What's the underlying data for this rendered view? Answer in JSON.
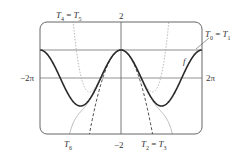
{
  "chart_data": {
    "type": "line",
    "title": "",
    "xlabel": "",
    "ylabel": "",
    "xlim": [
      -6.2832,
      6.2832
    ],
    "ylim": [
      -2,
      2
    ],
    "grid": false,
    "legend": "inline labels",
    "tick_labels": {
      "x_left": "−2π",
      "x_right": "2π",
      "y_top": "2",
      "y_bottom": "−2"
    },
    "series": [
      {
        "name": "f",
        "formula": "cos(x)",
        "style": "solid-thick",
        "color": "#2a2a2a",
        "label": "f"
      },
      {
        "name": "T0 = T1",
        "formula": "1",
        "style": "solid",
        "color": "#7a7a7a",
        "label": "T0 = T1"
      },
      {
        "name": "T2 = T3",
        "formula": "1 - x^2/2",
        "style": "dashed",
        "color": "#333333",
        "label": "T2 = T3"
      },
      {
        "name": "T4 = T5",
        "formula": "1 - x^2/2 + x^4/24",
        "style": "dotted",
        "color": "#b0b0b0",
        "label": "T4 = T5"
      },
      {
        "name": "T6",
        "formula": "1 - x^2/2 + x^4/24 - x^6/720",
        "style": "solid-thin",
        "color": "#a0a0a0",
        "label": "T6"
      }
    ]
  },
  "labels": {
    "t4t5": {
      "T": "T",
      "sub_a": "4",
      "eq": " = ",
      "sub_b": "5"
    },
    "t0t1": {
      "T": "T",
      "sub_a": "0",
      "eq": " = ",
      "sub_b": "1"
    },
    "t2t3": {
      "T": "T",
      "sub_a": "2",
      "eq": " = ",
      "sub_b": "3"
    },
    "t6": {
      "T": "T",
      "sub_a": "6"
    },
    "f": "f",
    "y_top": "2",
    "y_bottom": "−2",
    "x_left": "−2π",
    "x_right": "2π"
  }
}
